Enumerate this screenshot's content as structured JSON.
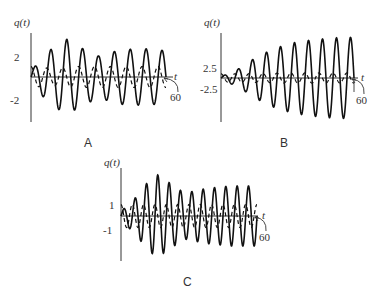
{
  "chart_data": [
    {
      "type": "line",
      "panel": "A",
      "ylabel": "q(t)",
      "xlabel": "t",
      "x_end_label": "60",
      "xlim": [
        0,
        60
      ],
      "yticks": [
        2,
        -2
      ],
      "ytick_labels": [
        "2",
        "-2"
      ],
      "series": [
        {
          "name": "solid",
          "style": "solid",
          "frequency_cycles": 8.5,
          "envelope": [
            [
              0,
              0.6
            ],
            [
              8,
              2.5
            ],
            [
              16,
              3.6
            ],
            [
              22,
              2.8
            ],
            [
              30,
              2.0
            ],
            [
              40,
              2.6
            ],
            [
              50,
              2.7
            ],
            [
              60,
              2.5
            ]
          ]
        },
        {
          "name": "dashed",
          "style": "dashed",
          "frequency_cycles": 8.5,
          "phase": 1.6,
          "envelope": [
            [
              0,
              1.0
            ],
            [
              10,
              0.8
            ],
            [
              20,
              1.0
            ],
            [
              40,
              1.0
            ],
            [
              60,
              1.0
            ]
          ]
        }
      ],
      "geom": {
        "x0": 31,
        "x1": 166,
        "y0": 77,
        "ytop": 33,
        "ybot": 122,
        "pxPerUnit": 10.5,
        "xAxisEnd": 173,
        "tX": 174,
        "tY": 80,
        "labX": 170,
        "labY": 101,
        "leaderFrom": [
          178,
          92
        ],
        "leaderTo": [
          164,
          78
        ],
        "yl": {
          "x": 14,
          "y": 26
        },
        "ticks": [
          {
            "v": 2,
            "x": 14,
            "y": 61
          },
          {
            "v": -2,
            "x": 10,
            "y": 104
          }
        ],
        "panelLabel": {
          "x": 84,
          "y": 147
        }
      }
    },
    {
      "type": "line",
      "panel": "B",
      "ylabel": "q(t)",
      "xlabel": "t",
      "x_end_label": "60",
      "xlim": [
        0,
        60
      ],
      "yticks": [
        2.5,
        -2.5
      ],
      "ytick_labels": [
        "2.5",
        "-2.5"
      ],
      "series": [
        {
          "name": "solid",
          "style": "solid",
          "frequency_cycles": 9.5,
          "envelope": [
            [
              0,
              0.3
            ],
            [
              8,
              2.2
            ],
            [
              16,
              5.0
            ],
            [
              24,
              7.0
            ],
            [
              32,
              8.3
            ],
            [
              40,
              9.0
            ],
            [
              50,
              9.5
            ],
            [
              60,
              9.7
            ]
          ]
        },
        {
          "name": "dashed",
          "style": "dashed",
          "frequency_cycles": 9.5,
          "phase": 1.6,
          "envelope": [
            [
              0,
              1.0
            ],
            [
              10,
              1.0
            ],
            [
              30,
              1.2
            ],
            [
              60,
              1.2
            ]
          ]
        }
      ],
      "geom": {
        "x0": 221,
        "x1": 354,
        "y0": 78,
        "ytop": 33,
        "ybot": 122,
        "pxPerUnit": 4.2,
        "xAxisEnd": 358,
        "tX": 361,
        "tY": 81,
        "labX": 356,
        "labY": 104,
        "leaderFrom": [
          364,
          94
        ],
        "leaderTo": [
          352,
          79
        ],
        "yl": {
          "x": 204,
          "y": 26
        },
        "ticks": [
          {
            "v": 2.5,
            "x": 203,
            "y": 72
          },
          {
            "v": -2.5,
            "x": 200,
            "y": 93
          }
        ],
        "panelLabel": {
          "x": 280,
          "y": 147
        },
        "endTick": true
      }
    },
    {
      "type": "line",
      "panel": "C",
      "ylabel": "q(t)",
      "xlabel": "t",
      "x_end_label": "60",
      "xlim": [
        0,
        60
      ],
      "yticks": [
        1,
        -1
      ],
      "ytick_labels": [
        "1",
        "-1"
      ],
      "series": [
        {
          "name": "solid",
          "style": "solid",
          "frequency_cycles": 12,
          "envelope": [
            [
              0,
              0.4
            ],
            [
              6,
              1.5
            ],
            [
              12,
              3.0
            ],
            [
              16,
              3.6
            ],
            [
              22,
              2.8
            ],
            [
              28,
              2.0
            ],
            [
              38,
              2.4
            ],
            [
              48,
              2.6
            ],
            [
              60,
              2.6
            ]
          ]
        },
        {
          "name": "dashed",
          "style": "dashed",
          "frequency_cycles": 12,
          "phase": 1.6,
          "envelope": [
            [
              0,
              1.0
            ],
            [
              20,
              1.0
            ],
            [
              60,
              1.0
            ]
          ]
        }
      ],
      "geom": {
        "x0": 121,
        "x1": 257,
        "y0": 216,
        "ytop": 168,
        "ybot": 261,
        "pxPerUnit": 11.5,
        "xAxisEnd": 258,
        "tX": 262,
        "tY": 219,
        "labX": 259,
        "labY": 241,
        "leaderFrom": [
          266,
          231
        ],
        "leaderTo": [
          255,
          217
        ],
        "yl": {
          "x": 104,
          "y": 166
        },
        "ticks": [
          {
            "v": 1,
            "x": 109,
            "y": 209
          },
          {
            "v": -1,
            "x": 103,
            "y": 234
          }
        ],
        "panelLabel": {
          "x": 183,
          "y": 286
        }
      }
    }
  ]
}
